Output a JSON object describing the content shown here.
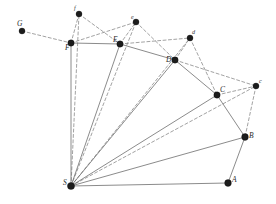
{
  "figure": {
    "background_color": "#ffffff",
    "solid_edge_color": "#6d6d6d",
    "dashed_edge_color": "#8a8a8a",
    "vertex_color": "#1c1c1c",
    "width": 276,
    "height": 204
  },
  "vertices": [
    {
      "id": "G",
      "label": "G",
      "x": 22,
      "y": 31,
      "r": 3.0,
      "label_dx": -5,
      "label_dy": -5,
      "kind": "major"
    },
    {
      "id": "f",
      "label": "f",
      "x": 79,
      "y": 14,
      "r": 3.0,
      "label_dx": -5,
      "label_dy": -4,
      "kind": "minor"
    },
    {
      "id": "F",
      "label": "F",
      "x": 71,
      "y": 43,
      "r": 3.2,
      "label_dx": -6,
      "label_dy": 7,
      "kind": "major"
    },
    {
      "id": "e",
      "label": "e",
      "x": 136,
      "y": 22,
      "r": 3.0,
      "label_dx": -5,
      "label_dy": -3,
      "kind": "minor"
    },
    {
      "id": "E",
      "label": "E",
      "x": 120,
      "y": 44,
      "r": 3.2,
      "label_dx": -7,
      "label_dy": -2,
      "kind": "major"
    },
    {
      "id": "d",
      "label": "d",
      "x": 190,
      "y": 38,
      "r": 3.0,
      "label_dx": 2,
      "label_dy": -4,
      "kind": "minor"
    },
    {
      "id": "D",
      "label": "D",
      "x": 175,
      "y": 60,
      "r": 3.2,
      "label_dx": -9,
      "label_dy": 2,
      "kind": "major"
    },
    {
      "id": "C",
      "label": "C",
      "x": 217,
      "y": 95,
      "r": 3.2,
      "label_dx": 3,
      "label_dy": -3,
      "kind": "major"
    },
    {
      "id": "c",
      "label": "c",
      "x": 256,
      "y": 86,
      "r": 3.0,
      "label_dx": 3,
      "label_dy": -3,
      "kind": "minor"
    },
    {
      "id": "B",
      "label": "B",
      "x": 245,
      "y": 137,
      "r": 3.4,
      "label_dx": 4,
      "label_dy": 1,
      "kind": "major"
    },
    {
      "id": "A",
      "label": "A",
      "x": 228,
      "y": 183,
      "r": 3.4,
      "label_dx": 4,
      "label_dy": -1,
      "kind": "major"
    },
    {
      "id": "S",
      "label": "S",
      "x": 71,
      "y": 186,
      "r": 3.6,
      "label_dx": -8,
      "label_dy": -1,
      "kind": "major"
    }
  ],
  "solid_edges": [
    {
      "from": "F",
      "to": "E",
      "name": "edge-F-E"
    },
    {
      "from": "E",
      "to": "D",
      "name": "edge-E-D"
    },
    {
      "from": "D",
      "to": "C",
      "name": "edge-D-C"
    },
    {
      "from": "C",
      "to": "B",
      "name": "edge-C-B"
    },
    {
      "from": "B",
      "to": "A",
      "name": "edge-B-A"
    },
    {
      "from": "A",
      "to": "S",
      "name": "edge-A-S"
    },
    {
      "from": "S",
      "to": "F",
      "name": "edge-S-F"
    },
    {
      "from": "S",
      "to": "E",
      "name": "edge-S-E"
    },
    {
      "from": "S",
      "to": "D",
      "name": "edge-S-D"
    },
    {
      "from": "S",
      "to": "C",
      "name": "edge-S-C"
    },
    {
      "from": "S",
      "to": "B",
      "name": "edge-S-B"
    }
  ],
  "dashed_edges": [
    {
      "from": "G",
      "to": "F",
      "name": "edge-G-F"
    },
    {
      "from": "F",
      "to": "f",
      "name": "edge-F-f"
    },
    {
      "from": "f",
      "to": "E",
      "name": "edge-f-E"
    },
    {
      "from": "F",
      "to": "e",
      "name": "edge-F-e"
    },
    {
      "from": "E",
      "to": "e",
      "name": "edge-E-e"
    },
    {
      "from": "e",
      "to": "D",
      "name": "edge-e-D"
    },
    {
      "from": "E",
      "to": "d",
      "name": "edge-E-d"
    },
    {
      "from": "D",
      "to": "d",
      "name": "edge-D-d"
    },
    {
      "from": "d",
      "to": "C",
      "name": "edge-d-C"
    },
    {
      "from": "D",
      "to": "c",
      "name": "edge-D-c"
    },
    {
      "from": "C",
      "to": "c",
      "name": "edge-C-c"
    },
    {
      "from": "c",
      "to": "B",
      "name": "edge-c-B"
    },
    {
      "from": "S",
      "to": "f",
      "name": "edge-S-f"
    },
    {
      "from": "S",
      "to": "e",
      "name": "edge-S-e"
    },
    {
      "from": "S",
      "to": "d",
      "name": "edge-S-d"
    },
    {
      "from": "S",
      "to": "c",
      "name": "edge-S-c"
    }
  ]
}
